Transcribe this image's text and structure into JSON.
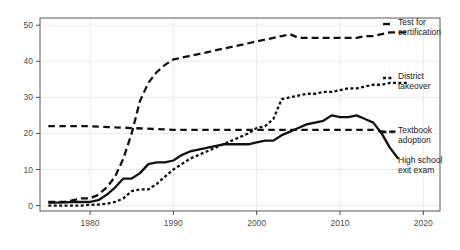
{
  "chart_data": {
    "type": "line",
    "title": "",
    "subtitle": "",
    "xlabel": "",
    "ylabel": "",
    "xlim": [
      1974,
      2022
    ],
    "ylim": [
      -1.5,
      52
    ],
    "grid": true,
    "grid_color": "#e8e8e8",
    "legend_position": "right-inline",
    "xticks": [
      1980,
      1990,
      2000,
      2010,
      2020
    ],
    "xtick_labels": [
      "1980",
      "1990",
      "2000",
      "2010",
      "2020"
    ],
    "yticks": [
      0,
      10,
      20,
      30,
      40,
      50
    ],
    "ytick_labels": [
      "0",
      "10",
      "20",
      "30",
      "40",
      "50"
    ],
    "series": [
      {
        "name": "Test for certification",
        "label_line1": "Test for",
        "label_line2": "certification",
        "dash": "long-dash",
        "dasharray": "7,4",
        "color": "#111111",
        "width": 2.3,
        "label_x": 398,
        "label_y1": 25,
        "label_y2": 35,
        "marker_x1": 383,
        "marker_x2": 394,
        "marker_y": 24,
        "x": [
          1975,
          1976,
          1977,
          1978,
          1979,
          1980,
          1981,
          1982,
          1983,
          1984,
          1985,
          1986,
          1987,
          1988,
          1989,
          1990,
          1991,
          1992,
          1993,
          1994,
          1995,
          1996,
          1997,
          1998,
          1999,
          2000,
          2001,
          2002,
          2003,
          2004,
          2005,
          2006,
          2007,
          2008,
          2009,
          2010,
          2011,
          2012,
          2013,
          2014,
          2015,
          2016,
          2017,
          2018
        ],
        "y": [
          1,
          1,
          1,
          1.5,
          2,
          2,
          3,
          5,
          8,
          13,
          20,
          29,
          34,
          37,
          39,
          40.5,
          41,
          41.5,
          42,
          42.5,
          43,
          43.5,
          44,
          44.5,
          45,
          45.5,
          46,
          46.5,
          47,
          47.5,
          46.5,
          46.5,
          46.5,
          46.5,
          46.5,
          46.5,
          46.5,
          46.5,
          47,
          47,
          47.5,
          48,
          48,
          48
        ]
      },
      {
        "name": "District takeover",
        "label_line1": "District",
        "label_line2": "takeover",
        "dash": "dotted-short",
        "dasharray": "3,2.4",
        "color": "#111111",
        "width": 2.3,
        "label_x": 398,
        "label_y1": 79,
        "label_y2": 89,
        "marker_x1": 383,
        "marker_x2": 394,
        "marker_y": 78,
        "x": [
          1975,
          1976,
          1977,
          1978,
          1979,
          1980,
          1981,
          1982,
          1983,
          1984,
          1985,
          1986,
          1987,
          1988,
          1989,
          1990,
          1991,
          1992,
          1993,
          1994,
          1995,
          1996,
          1997,
          1998,
          1999,
          2000,
          2001,
          2002,
          2003,
          2004,
          2005,
          2006,
          2007,
          2008,
          2009,
          2010,
          2011,
          2012,
          2013,
          2014,
          2015,
          2016,
          2017,
          2018
        ],
        "y": [
          0,
          0,
          0,
          0,
          0,
          0.2,
          0.3,
          0.5,
          1,
          2,
          4,
          4.5,
          4.5,
          6,
          8,
          10,
          11.5,
          13,
          14,
          15,
          16,
          17,
          18,
          19,
          20,
          21.5,
          22,
          24,
          29.5,
          30,
          30.5,
          31,
          31,
          31.5,
          31.5,
          32,
          32.5,
          32.5,
          33,
          33.5,
          33.5,
          34,
          34,
          34
        ]
      },
      {
        "name": "Textbook adoption",
        "label_line1": "Textbook",
        "label_line2": "adoption",
        "dash": "medium-dash",
        "dasharray": "6.5,4.5",
        "color": "#111111",
        "width": 2.3,
        "label_x": 398,
        "label_y1": 133,
        "label_y2": 143,
        "marker_x1": 380,
        "marker_x2": 393,
        "marker_y": 132,
        "x": [
          1975,
          1980,
          1985,
          1990,
          1995,
          2000,
          2005,
          2010,
          2014,
          2015,
          2016,
          2017
        ],
        "y": [
          22,
          22,
          21.5,
          21,
          21,
          21,
          21,
          21,
          21,
          20.5,
          20.5,
          20.5
        ]
      },
      {
        "name": "High school exit exam",
        "label_line1": "High school",
        "label_line2": "exit exam",
        "dash": "solid",
        "dasharray": "",
        "color": "#111111",
        "width": 2.3,
        "label_x": 398,
        "label_y1": 163,
        "label_y2": 173,
        "marker_x1": 0,
        "marker_x2": 0,
        "marker_y": 0,
        "x": [
          1975,
          1976,
          1977,
          1978,
          1979,
          1980,
          1981,
          1982,
          1983,
          1984,
          1985,
          1986,
          1987,
          1988,
          1989,
          1990,
          1991,
          1992,
          1993,
          1994,
          1995,
          1996,
          1997,
          1998,
          1999,
          2000,
          2001,
          2002,
          2003,
          2004,
          2005,
          2006,
          2007,
          2008,
          2009,
          2010,
          2011,
          2012,
          2013,
          2014,
          2015,
          2016,
          2017
        ],
        "y": [
          0.8,
          0.8,
          0.9,
          1,
          1,
          1,
          1.5,
          3,
          5,
          7.5,
          7.5,
          9,
          11.5,
          12,
          12,
          12.5,
          14,
          15,
          15.5,
          16,
          16.5,
          17,
          17,
          17,
          17,
          17.5,
          18,
          18,
          19.5,
          20.5,
          21.5,
          22.5,
          23,
          23.5,
          25,
          24.5,
          24.5,
          25,
          24,
          23,
          20,
          16,
          13
        ]
      }
    ]
  },
  "axes": {
    "left_px": 40,
    "right_px": 440,
    "top_px": 18,
    "bottom_px": 211,
    "tick_color": "#4d4d4d",
    "border_color": "#595959"
  }
}
